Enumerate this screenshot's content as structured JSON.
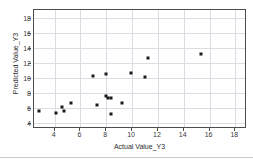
{
  "chart_data": {
    "type": "scatter",
    "title": "",
    "xlabel": "Actual Value_Y3",
    "ylabel": "Predicted Value_Y3",
    "xlim": [
      2.4,
      18.9
    ],
    "ylim": [
      3.2,
      19.0
    ],
    "xticks": [
      4,
      6,
      8,
      10,
      12,
      14,
      16,
      18
    ],
    "yticks": [
      4,
      6,
      8,
      10,
      12,
      14,
      16,
      18
    ],
    "xtick_labels": [
      "4",
      "6",
      "8",
      "10",
      "12",
      "14",
      "16",
      "18"
    ],
    "ytick_labels": [
      "4",
      "6",
      "8",
      "10",
      "12",
      "14",
      "16",
      "18"
    ],
    "grid": true,
    "legend": "none",
    "marker": "square",
    "marker_color": "#1a1a1a",
    "points": [
      {
        "x": 2.8,
        "y": 5.6
      },
      {
        "x": 4.1,
        "y": 5.35
      },
      {
        "x": 4.6,
        "y": 6.1
      },
      {
        "x": 4.7,
        "y": 5.6
      },
      {
        "x": 5.3,
        "y": 6.7
      },
      {
        "x": 7.0,
        "y": 10.2
      },
      {
        "x": 7.3,
        "y": 6.4
      },
      {
        "x": 8.0,
        "y": 10.45
      },
      {
        "x": 8.0,
        "y": 7.6
      },
      {
        "x": 8.1,
        "y": 7.3
      },
      {
        "x": 8.35,
        "y": 7.25
      },
      {
        "x": 8.4,
        "y": 5.15
      },
      {
        "x": 9.25,
        "y": 6.7
      },
      {
        "x": 9.9,
        "y": 10.7
      },
      {
        "x": 11.0,
        "y": 10.05
      },
      {
        "x": 11.2,
        "y": 12.65
      },
      {
        "x": 15.3,
        "y": 13.2
      }
    ]
  }
}
